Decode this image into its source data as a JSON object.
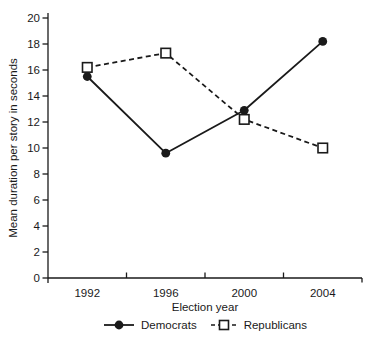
{
  "colors": {
    "ink": "#1a1a1a",
    "background": "#ffffff"
  },
  "chart_data": {
    "type": "line",
    "title": "",
    "categories": [
      "1992",
      "1996",
      "2000",
      "2004"
    ],
    "series": [
      {
        "name": "Democrats",
        "values": [
          15.5,
          9.6,
          12.9,
          18.2
        ],
        "marker": "filled-circle",
        "line_style": "solid",
        "color": "#1a1a1a"
      },
      {
        "name": "Republicans",
        "values": [
          16.2,
          17.3,
          12.2,
          10.0
        ],
        "marker": "open-square",
        "line_style": "dashed",
        "color": "#1a1a1a"
      }
    ],
    "xlabel": "Election year",
    "ylabel": "Mean duration per story in seconds",
    "ylim": [
      0,
      20
    ],
    "ytick_step": 2,
    "yticks": [
      0,
      2,
      4,
      6,
      8,
      10,
      12,
      14,
      16,
      18,
      20
    ],
    "x_axis_type": "categorical",
    "grid": false,
    "legend_position": "bottom"
  }
}
